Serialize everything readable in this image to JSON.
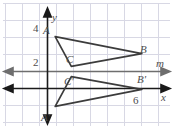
{
  "figure": {
    "axes": {
      "x_axis_label": "x",
      "y_axis_label": "y",
      "x_tick_label": "6",
      "y_tick_labels": [
        "4",
        "2"
      ],
      "line_label": "m"
    },
    "colors": {
      "grid": "#d8d8e4",
      "axis": "#1a1a1a",
      "mirror_line": "#6e6e6e",
      "shape": "#3c3c3c",
      "label_text": "#4d4d4d",
      "background": "#ffffff"
    },
    "points": [
      {
        "name": "A",
        "label": "A",
        "x": 0.45,
        "y": 3.05
      },
      {
        "name": "B",
        "label": "B",
        "x": 5.55,
        "y": 2.05
      },
      {
        "name": "C",
        "label": "C",
        "x": 1.4,
        "y": 1.3
      },
      {
        "name": "A'",
        "label": "A'",
        "x": 0.45,
        "y": -1.05
      },
      {
        "name": "B'",
        "label": "B'",
        "x": 5.55,
        "y": -0.05
      },
      {
        "name": "C'",
        "label": "C'",
        "x": 1.4,
        "y": 0.7
      }
    ],
    "shapes": [
      {
        "name": "triangle-abc",
        "vertices": [
          "A",
          "B",
          "C"
        ]
      },
      {
        "name": "triangle-abc-image",
        "vertices": [
          "A'",
          "B'",
          "C'"
        ]
      }
    ],
    "grid": {
      "spacing_px": 17,
      "x_lines": [
        5,
        22,
        39,
        56,
        73,
        90,
        107,
        124,
        141,
        158
      ],
      "y_lines": [
        3,
        20,
        37,
        54,
        71,
        88,
        105,
        122
      ]
    }
  }
}
